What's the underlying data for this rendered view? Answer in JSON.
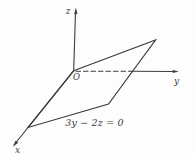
{
  "figure": {
    "background": "#fdfdfd",
    "ink": "#3c3c3c",
    "labels": {
      "z_axis": "z",
      "y_axis": "y",
      "x_axis": "x",
      "origin": "O",
      "plane_equation": "3y − 2z = 0"
    }
  }
}
